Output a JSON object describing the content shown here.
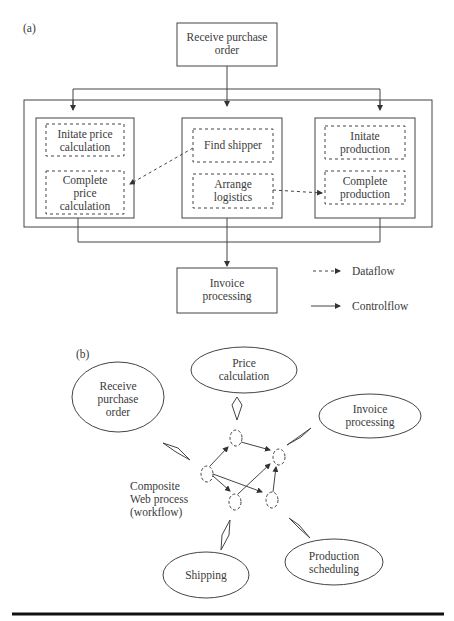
{
  "panel_a": {
    "label": "(a)",
    "start": "Receive purchase order",
    "groups": [
      {
        "tasks": [
          "Initate price calculation",
          "Complete price calculation"
        ]
      },
      {
        "tasks": [
          "Find shipper",
          "Arrange logistics"
        ]
      },
      {
        "tasks": [
          "Initate production",
          "Complete production"
        ]
      }
    ],
    "end": "Invoice processing",
    "legend": {
      "dataflow": "Dataflow",
      "controlflow": "Controlflow"
    }
  },
  "panel_b": {
    "label": "(b)",
    "services": {
      "price": "Price calculation",
      "receive": "Receive purchase order",
      "invoice": "Invoice processing",
      "shipping": "Shipping",
      "production": "Production scheduling"
    },
    "composite_label": "Composite Web process (workflow)"
  }
}
